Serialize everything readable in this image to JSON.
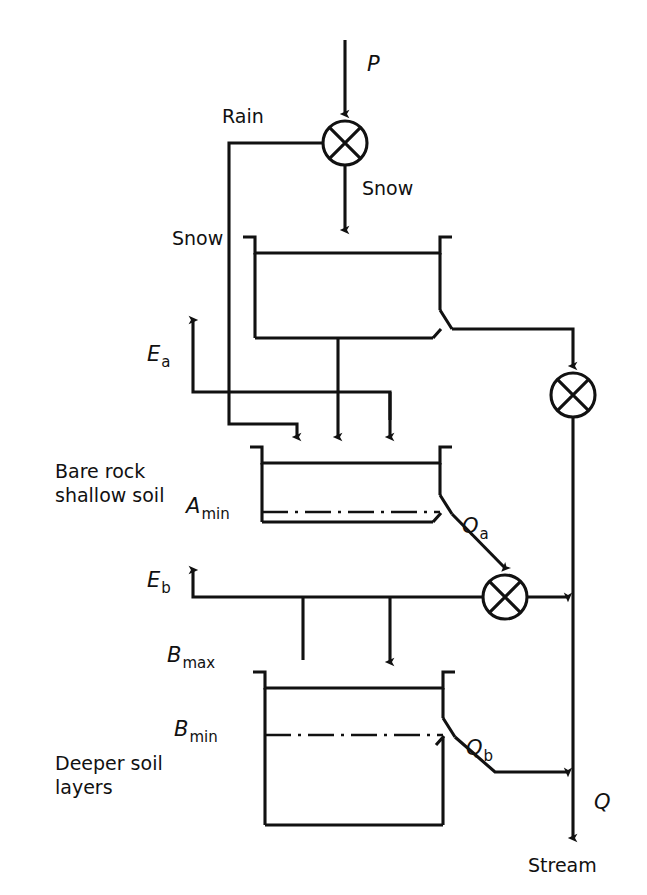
{
  "diagram": {
    "type": "flow-diagram",
    "stroke_color": "#111111",
    "background_color": "#ffffff",
    "labels": {
      "precipitation": "P",
      "rain": "Rain",
      "snow_flow": "Snow",
      "snow_store": "Snow",
      "evap_a": "E",
      "evap_a_sub": "a",
      "evap_b": "E",
      "evap_b_sub": "b",
      "a_min": "A",
      "a_min_sub": "min",
      "b_max": "B",
      "b_max_sub": "max",
      "b_min": "B",
      "b_min_sub": "min",
      "q_a": "Q",
      "q_a_sub": "a",
      "q_b": "Q",
      "q_b_sub": "b",
      "q_total": "Q",
      "stream": "Stream",
      "bare_rock_line1": "Bare rock",
      "bare_rock_line2": "shallow soil",
      "deeper_line1": "Deeper soil",
      "deeper_line2": "layers"
    },
    "reservoirs": [
      {
        "name": "snow-store",
        "label": "Snow",
        "x": 255,
        "y": 237,
        "width": 185,
        "height": 101
      },
      {
        "name": "bare-rock-shallow-soil-store",
        "label": "Bare rock shallow soil",
        "x": 262,
        "y": 447,
        "width": 178,
        "height": 75,
        "threshold_label": "A min",
        "threshold_y": 512
      },
      {
        "name": "deeper-soil-store",
        "label": "Deeper soil layers",
        "x": 265,
        "y": 672,
        "width": 178,
        "height": 153,
        "threshold_label": "B min",
        "threshold_y": 735
      }
    ],
    "junctions": [
      {
        "name": "precipitation-splitter",
        "cx": 345,
        "cy": 143,
        "r": 22
      },
      {
        "name": "upper-flow-junction",
        "cx": 573,
        "cy": 395,
        "r": 22
      },
      {
        "name": "lower-flow-junction",
        "cx": 505,
        "cy": 597,
        "r": 22
      }
    ],
    "flows": [
      {
        "name": "precipitation-inflow",
        "from": "top",
        "to": "precipitation-splitter",
        "label": "P"
      },
      {
        "name": "rain-branch",
        "from": "precipitation-splitter",
        "to": "bare-rock-shallow-soil-store",
        "label": "Rain"
      },
      {
        "name": "snow-branch",
        "from": "precipitation-splitter",
        "to": "snow-store",
        "label": "Snow"
      },
      {
        "name": "snowmelt-outflow",
        "from": "snow-store",
        "to": "upper-flow-junction",
        "label": ""
      },
      {
        "name": "evaporation-a",
        "from": "bare-rock-shallow-soil-store",
        "to": "atmosphere",
        "label": "E a"
      },
      {
        "name": "evaporation-b",
        "from": "deeper-soil-store",
        "to": "atmosphere",
        "label": "E b"
      },
      {
        "name": "quickflow-a",
        "from": "bare-rock-shallow-soil-store",
        "to": "lower-flow-junction",
        "label": "Q a"
      },
      {
        "name": "baseflow-b",
        "from": "deeper-soil-store",
        "to": "stream",
        "label": "Q b"
      },
      {
        "name": "stream-outflow",
        "from": "upper-flow-junction",
        "to": "stream",
        "label": "Q"
      }
    ]
  }
}
